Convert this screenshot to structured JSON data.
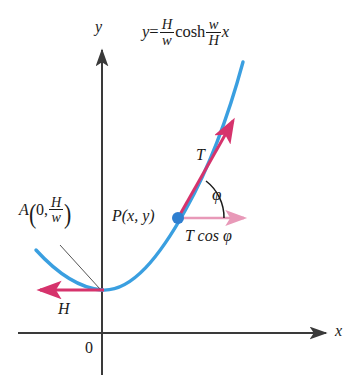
{
  "figure": {
    "width": 354,
    "height": 380,
    "background": "#ffffff"
  },
  "colors": {
    "curve": "#3a9fe0",
    "force_arrow": "#d6336c",
    "horizontal_component_arrow": "#e899b8",
    "point_marker": "#2f7fd0",
    "axis": "#3a3a3a",
    "text": "#1a1a1a",
    "leader_line": "#555555"
  },
  "labels": {
    "equation": {
      "name": "curve-equation",
      "plain": "y = (H/w) cosh (w/H) x",
      "lhs": "y",
      "equals": "=",
      "frac1_num": "H",
      "frac1_den": "w",
      "cosh": "cosh",
      "frac2_num": "w",
      "frac2_den": "H",
      "variable": "x"
    },
    "y_axis": "y",
    "x_axis": "x",
    "origin": "0",
    "point_A": {
      "plain": "A (0, H/w)",
      "letter": "A",
      "open_paren": "(",
      "zero": "0",
      "comma": ",",
      "frac_num": "H",
      "frac_den": "w",
      "close_paren": ")"
    },
    "point_P": "P(x, y)",
    "tension": "T",
    "angle": "φ",
    "horizontal_component": "T cos φ",
    "horizontal_tension": "H"
  },
  "geometry": {
    "axes": {
      "x_axis_y": 333,
      "y_axis_x": 102,
      "x_axis_from": 18,
      "x_axis_to": 330,
      "y_axis_from": 375,
      "y_axis_to": 45
    },
    "curve_vertex": [
      102,
      290
    ],
    "curve_left_end": [
      36,
      250
    ],
    "curve_right_end": [
      243,
      62
    ],
    "point_P": [
      178,
      218
    ],
    "tension_arrow_tip": [
      236,
      117
    ],
    "horizontal_arrow_tip": [
      248,
      218
    ],
    "horizontal_tension_arrow_tip": [
      36,
      290
    ],
    "angle_arc_radius": 46,
    "angle_degrees": 52
  }
}
